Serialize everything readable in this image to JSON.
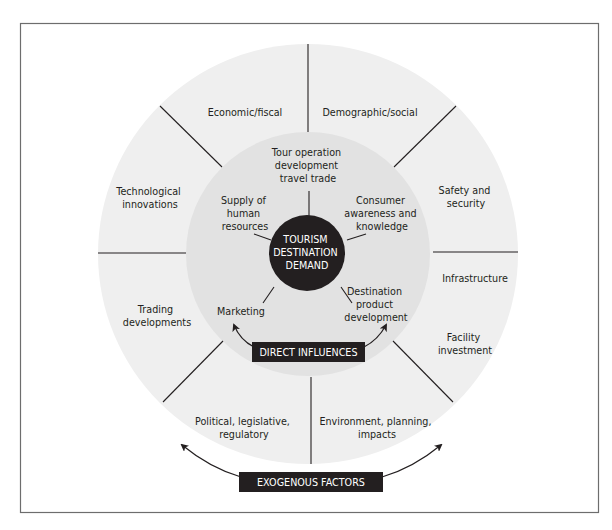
{
  "diagram": {
    "colors": {
      "outer_ring": "#efefef",
      "inner_ring": "#e2e2e2",
      "core": "#231f20",
      "lines": "#231f20",
      "frame": "#6d6d6d"
    },
    "core": {
      "lines": [
        "TOURISM",
        "DESTINATION",
        "DEMAND"
      ]
    },
    "direct_influences": {
      "label": "DIRECT INFLUENCES",
      "items": [
        {
          "lines": [
            "Tour operation",
            "development",
            "travel trade"
          ]
        },
        {
          "lines": [
            "Consumer",
            "awareness and",
            "knowledge"
          ]
        },
        {
          "lines": [
            "Destination",
            "product",
            "development"
          ]
        },
        {
          "lines": [
            "Marketing"
          ]
        },
        {
          "lines": [
            "Supply of",
            "human",
            "resources"
          ]
        }
      ]
    },
    "exogenous_factors": {
      "label": "EXOGENOUS FACTORS",
      "items": [
        {
          "lines": [
            "Economic/fiscal"
          ]
        },
        {
          "lines": [
            "Demographic/social"
          ]
        },
        {
          "lines": [
            "Safety and",
            "security"
          ]
        },
        {
          "lines": [
            "Infrastructure"
          ]
        },
        {
          "lines": [
            "Facility",
            "investment"
          ]
        },
        {
          "lines": [
            "Environment, planning,",
            "impacts"
          ]
        },
        {
          "lines": [
            "Political, legislative,",
            "regulatory"
          ]
        },
        {
          "lines": [
            "Trading",
            "developments"
          ]
        },
        {
          "lines": [
            "Technological",
            "innovations"
          ]
        }
      ]
    }
  }
}
